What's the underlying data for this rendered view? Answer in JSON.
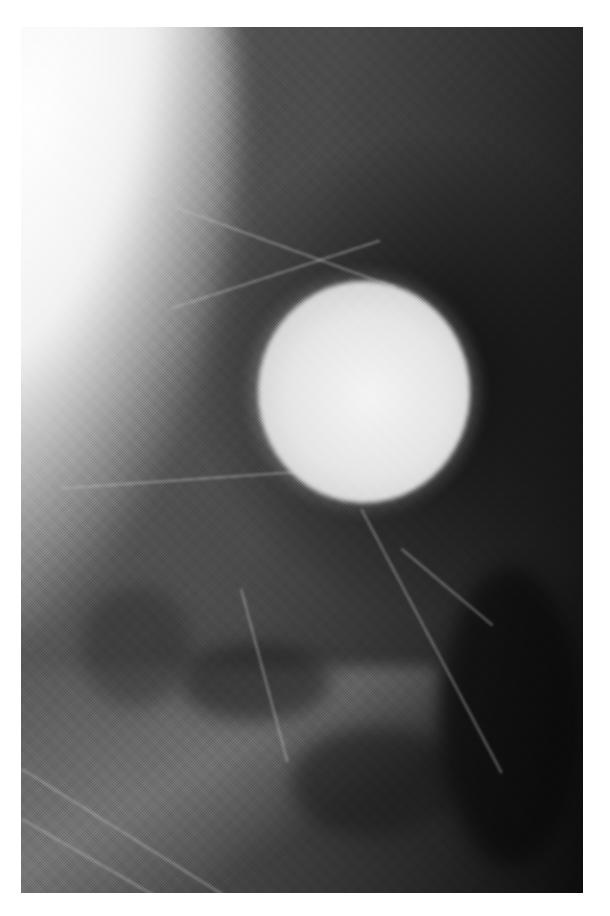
{
  "image": {
    "type": "grayscale radiograph",
    "description": "Mammogram-style X-ray showing fibroglandular tissue with a large well-circumscribed round bright mass in the upper-right center",
    "colors": {
      "background": "#ffffff",
      "tissue": "#4a4a4a",
      "dark_region": "#0c0c0c",
      "mass": "#e6e6e6",
      "skin_edge": "#f2f2f2"
    }
  }
}
